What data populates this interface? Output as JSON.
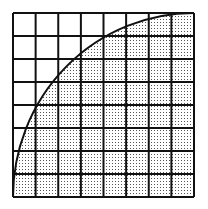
{
  "diagram": {
    "grid": {
      "rows": 8,
      "cols": 8,
      "x0": 13,
      "y0": 13,
      "x1": 194,
      "y1": 197,
      "line_color": "#111111",
      "line_width": 2
    },
    "arc": {
      "type": "quarter-circle",
      "center_corner": "bottom-right",
      "from": "bottom-left corner",
      "to": "top-right corner",
      "color": "#111111",
      "width": 2
    },
    "shading": {
      "region": "inside quarter circle",
      "pattern": "stipple-dots",
      "dot_color": "#555555",
      "background": "#ffffff"
    }
  }
}
